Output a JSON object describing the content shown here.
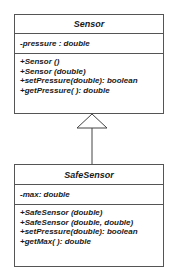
{
  "diagram": {
    "type": "UML class diagram",
    "relationship": "generalization",
    "classes": [
      {
        "name": "Sensor",
        "attributes": [
          "-pressure : double"
        ],
        "operations": [
          "+Sensor ()",
          "+Sensor (double)",
          "+setPressure(double): boolean",
          "+getPressure( ): double"
        ]
      },
      {
        "name": "SafeSensor",
        "attributes": [
          "-max: double"
        ],
        "operations": [
          "+SafeSensor (double)",
          "+SafeSensor (double, double)",
          "+setPressure(double): boolean",
          "+getMax( ): double"
        ]
      }
    ]
  }
}
